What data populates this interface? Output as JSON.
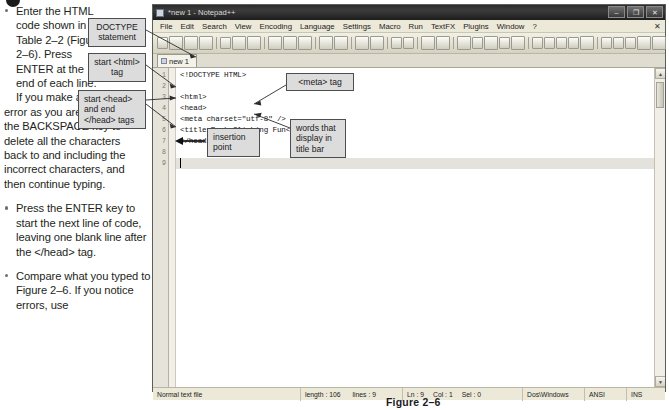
{
  "steps": {
    "bullet_icon": "filled-circle-bullet",
    "items": [
      {
        "id": "step-1",
        "text_head": "Enter the HTML code shown in Table 2–2 (Figure 2–6). Press ENTER at the end of each line. If you make an",
        "text_rest": "error as you are typing, use the BACKSPACE key to delete all the characters back to and including the incorrect characters, and then continue typing."
      },
      {
        "id": "step-2",
        "text": "Press the ENTER key to start the next line of code, leaving one blank line after the </head> tag."
      },
      {
        "id": "step-3",
        "text": "Compare what you typed to Figure 2–6. If you notice errors, use"
      }
    ]
  },
  "figure": {
    "caption": "Figure 2–6"
  },
  "callouts": [
    {
      "id": "doctype",
      "text": "DOCTYPE statement"
    },
    {
      "id": "html",
      "text": "start <html> tag"
    },
    {
      "id": "head",
      "text": "start <head> and end </head> tags"
    },
    {
      "id": "meta",
      "text": "<meta> tag"
    },
    {
      "id": "words",
      "text": "words that display in title bar"
    },
    {
      "id": "insertion",
      "text": "insertion point"
    }
  ],
  "npp": {
    "title": "*new 1 - Notepad++",
    "window_controls": {
      "minimize": "–",
      "maximize": "❐",
      "close": "✕"
    },
    "menu": [
      "File",
      "Edit",
      "Search",
      "View",
      "Encoding",
      "Language",
      "Settings",
      "Macro",
      "Run",
      "TextFX",
      "Plugins",
      "Window",
      "?"
    ],
    "menu_close_label": "✕",
    "toolbar_icons": [
      "new-file-icon",
      "open-file-icon",
      "save-icon",
      "save-all-icon",
      "close-icon",
      "close-all-icon",
      "print-icon",
      "cut-icon",
      "copy-icon",
      "paste-icon",
      "undo-icon",
      "redo-icon",
      "find-icon",
      "replace-icon",
      "zoom-in-icon",
      "zoom-out-icon",
      "sync-vertical-icon",
      "sync-horizontal-icon",
      "word-wrap-icon",
      "all-chars-icon",
      "indent-guide-icon",
      "ui-user-defined-icon",
      "show-doc-map-icon",
      "fold-all-icon",
      "unfold-all-icon",
      "record-macro-icon",
      "stop-macro-icon",
      "play-macro-icon",
      "playback-multiple-icon",
      "save-macro-icon",
      "sum-icon",
      "previous-icon",
      "next-icon",
      "find-chars-icon",
      "run-icon",
      "spellcheck-icon"
    ],
    "tab": {
      "label": "new 1",
      "icon": "document-icon"
    },
    "editor": {
      "line_numbers": [
        "1",
        "2",
        "3",
        "4",
        "5",
        "6",
        "7",
        "8",
        "9"
      ],
      "lines": [
        "<!DOCTYPE HTML>",
        "",
        "<html>",
        "<head>",
        "<meta charset=\"utf-8\" />",
        "<title>Rock Climbing Fun</title>",
        "</head>",
        "",
        ""
      ],
      "current_line": 9,
      "caret_col": 1
    },
    "status_bar": {
      "doc_type": "Normal text file",
      "length_label": "length : 106",
      "lines_label": "lines : 9",
      "ln_label": "Ln : 9",
      "col_label": "Col : 1",
      "sel_label": "Sel : 0",
      "eol": "Dos\\Windows",
      "encoding": "ANSI",
      "insert_mode": "INS"
    },
    "scrollbar": {
      "up_arrow": "▲",
      "down_arrow": "▼"
    }
  },
  "colors": {
    "callout_bg": "#dcdcdc",
    "callout_border": "#4d4d4d",
    "title_bar": "#2b2b2b",
    "chrome_bg": "#ece9d8",
    "editor_bg": "#ffffff",
    "current_line": "#e4e2dc"
  }
}
